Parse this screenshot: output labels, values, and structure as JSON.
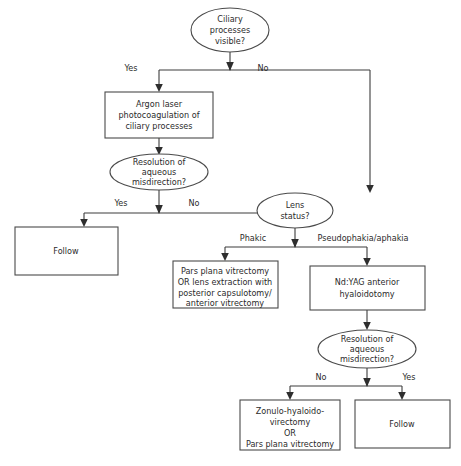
{
  "diagram": {
    "background_color": "#ffffff",
    "stroke_color": "#4a4a4a",
    "text_color": "#2b2b2b"
  },
  "nodes": {
    "ciliary_processes": {
      "shape": "ellipse",
      "lines": [
        "Ciliary",
        "processes",
        "visible?"
      ]
    },
    "argon_laser": {
      "shape": "rect",
      "lines": [
        "Argon laser",
        "photocoagulation of",
        "ciliary processes"
      ]
    },
    "resolution_1": {
      "shape": "ellipse",
      "lines": [
        "Resolution of",
        "aqueous",
        "misdirection?"
      ]
    },
    "follow_left": {
      "shape": "rect",
      "lines": [
        "Follow"
      ]
    },
    "lens_status": {
      "shape": "ellipse",
      "lines": [
        "Lens",
        "status?"
      ]
    },
    "pars_plana": {
      "shape": "rect",
      "lines": [
        "Pars plana vitrectomy",
        "OR lens extraction with",
        "posterior capsulotomy/",
        "anterior vitrectomy"
      ]
    },
    "ndyag": {
      "shape": "rect",
      "lines": [
        "Nd:YAG anterior",
        "hyaloidotomy"
      ]
    },
    "resolution_2": {
      "shape": "ellipse",
      "lines": [
        "Resolution of",
        "aqueous",
        "misdirection?"
      ]
    },
    "zonulo": {
      "shape": "rect",
      "lines": [
        "Zonulo-hyaloido-",
        "virectomy",
        "OR",
        "Pars plana vitrectomy"
      ]
    },
    "follow_right": {
      "shape": "rect",
      "lines": [
        "Follow"
      ]
    }
  },
  "edge_labels": {
    "top_yes": "Yes",
    "top_no": "No",
    "res1_yes": "Yes",
    "res1_no": "No",
    "lens_phakic": "Phakic",
    "lens_pseudophakia": "Pseudophakia/aphakia",
    "res2_no": "No",
    "res2_yes": "Yes"
  }
}
